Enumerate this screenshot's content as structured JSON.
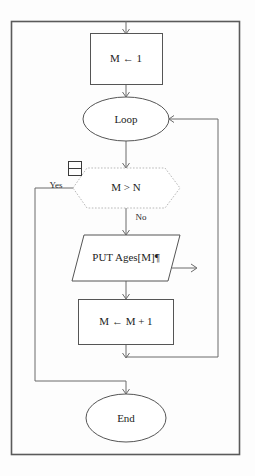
{
  "diagram": {
    "frame": {
      "border_color": "#5a5a5a"
    },
    "nodes": {
      "init": {
        "label": "M ← 1",
        "type": "process"
      },
      "loop": {
        "label": "Loop",
        "type": "terminator"
      },
      "decision": {
        "label": "M > N",
        "type": "decision"
      },
      "output": {
        "label": "PUT Ages[M]¶",
        "type": "input-output"
      },
      "increment": {
        "label": "M ← M + 1",
        "type": "process"
      },
      "end": {
        "label": "End",
        "type": "terminator"
      }
    },
    "edge_labels": {
      "yes": "Yes",
      "no": "No"
    },
    "colors": {
      "node_stroke": "#555555",
      "decision_stroke": "#b9b9b9",
      "connector": "#6a6a6a",
      "text": "#1d1d1d",
      "background": "#ffffff"
    }
  }
}
